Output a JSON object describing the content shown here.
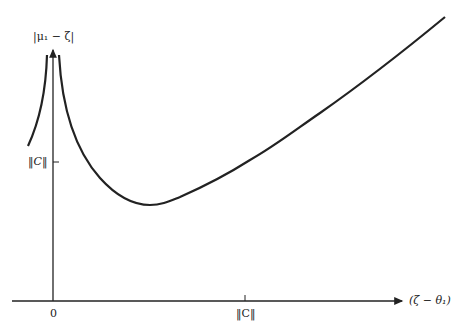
{
  "diagram": {
    "y_axis_label": "|μ₁ − ζ|",
    "x_axis_label": "(ζ − θ₁)",
    "y_tick_label": "‖C‖",
    "x_tick_labels": [
      "0",
      "‖C‖"
    ],
    "colors": {
      "stroke": "#222222",
      "background": "#ffffff"
    }
  }
}
